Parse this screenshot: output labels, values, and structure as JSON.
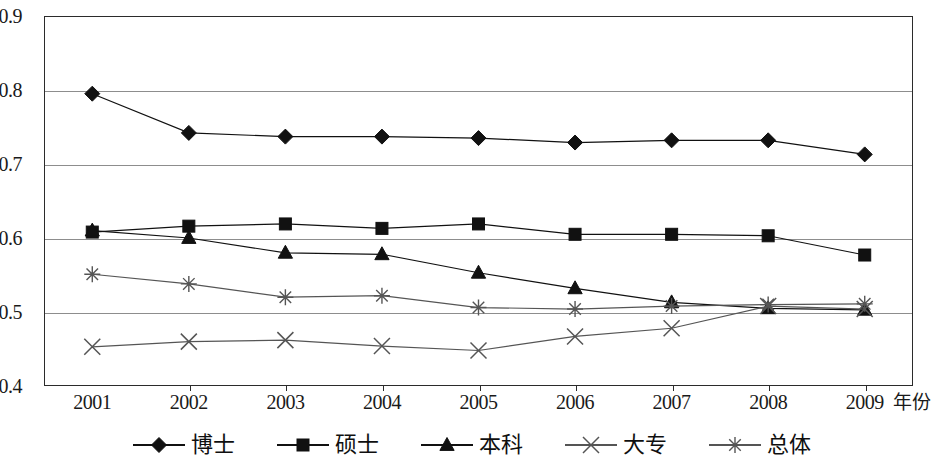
{
  "chart_data": {
    "type": "line",
    "title": "",
    "subtitle": "",
    "xlabel": "年份",
    "ylabel": "",
    "categories": [
      "2001",
      "2002",
      "2003",
      "2004",
      "2005",
      "2006",
      "2007",
      "2008",
      "2009"
    ],
    "x": [
      2001,
      2002,
      2003,
      2004,
      2005,
      2006,
      2007,
      2008,
      2009
    ],
    "xlim": [
      2001,
      2009
    ],
    "ylim": [
      0.4,
      0.9
    ],
    "yticks": [
      "0.4",
      "0.5",
      "0.6",
      "0.7",
      "0.8",
      "0.9"
    ],
    "ytick_values": [
      0.4,
      0.5,
      0.6,
      0.7,
      0.8,
      0.9
    ],
    "grid": true,
    "grid_axis": "y",
    "legend_position": "bottom",
    "series": [
      {
        "name": "博士",
        "marker": "diamond",
        "color": "#111111",
        "values": [
          0.795,
          0.742,
          0.737,
          0.737,
          0.735,
          0.729,
          0.732,
          0.732,
          0.713
        ]
      },
      {
        "name": "硕士",
        "marker": "square",
        "color": "#111111",
        "values": [
          0.608,
          0.616,
          0.619,
          0.613,
          0.619,
          0.605,
          0.605,
          0.603,
          0.577
        ]
      },
      {
        "name": "本科",
        "marker": "triangle",
        "color": "#111111",
        "values": [
          0.61,
          0.6,
          0.58,
          0.578,
          0.553,
          0.532,
          0.513,
          0.505,
          0.503
        ]
      },
      {
        "name": "大专",
        "marker": "x",
        "color": "#555555",
        "values": [
          0.453,
          0.46,
          0.462,
          0.454,
          0.448,
          0.467,
          0.478,
          0.508,
          0.504
        ]
      },
      {
        "name": "总体",
        "marker": "asterisk",
        "color": "#555555",
        "values": [
          0.551,
          0.538,
          0.52,
          0.522,
          0.506,
          0.504,
          0.508,
          0.51,
          0.511
        ]
      }
    ]
  },
  "axis": {
    "y_labels": [
      "0.9",
      "0.8",
      "0.7",
      "0.6",
      "0.5",
      "0.4"
    ],
    "x_labels": [
      "2001",
      "2002",
      "2003",
      "2004",
      "2005",
      "2006",
      "2007",
      "2008",
      "2009"
    ],
    "x_title": "年份"
  },
  "legend": {
    "items": [
      {
        "label": "博士",
        "marker": "diamond"
      },
      {
        "label": "硕士",
        "marker": "square"
      },
      {
        "label": "本科",
        "marker": "triangle"
      },
      {
        "label": "大专",
        "marker": "x"
      },
      {
        "label": "总体",
        "marker": "asterisk"
      }
    ]
  }
}
